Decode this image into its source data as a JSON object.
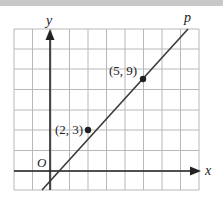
{
  "diagram": {
    "type": "coordinate-grid-line",
    "axes": {
      "x_label": "x",
      "y_label": "y",
      "origin_label": "O"
    },
    "line_label": "p",
    "points": [
      {
        "label": "(2, 3)",
        "x": 2,
        "y": 3
      },
      {
        "label": "(5, 9)",
        "x": 5,
        "y": 9
      }
    ],
    "colors": {
      "grid": "#b8b8b8",
      "axis": "#222222",
      "line": "#3a3a3a",
      "point": "#222222",
      "top_bar": "#c8c8c8"
    }
  }
}
